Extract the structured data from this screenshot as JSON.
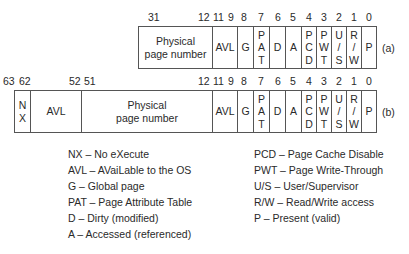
{
  "row_a": {
    "tag": "(a)",
    "bits": [
      {
        "label": "31",
        "x": 148
      },
      {
        "label": "12",
        "x": 198
      },
      {
        "label": "11",
        "x": 213
      },
      {
        "label": "9",
        "x": 228
      },
      {
        "label": "8",
        "x": 241
      },
      {
        "label": "7",
        "x": 258
      },
      {
        "label": "6",
        "x": 275
      },
      {
        "label": "5",
        "x": 290
      },
      {
        "label": "4",
        "x": 306
      },
      {
        "label": "3",
        "x": 321
      },
      {
        "label": "2",
        "x": 336
      },
      {
        "label": "1",
        "x": 351
      },
      {
        "label": "0",
        "x": 366
      }
    ],
    "fields": [
      {
        "name": "physical-page-number",
        "lines": [
          "Physical",
          "page number"
        ],
        "x": 138,
        "w": 74
      },
      {
        "name": "avl",
        "lines": [
          "AVL"
        ],
        "x": 212,
        "w": 25
      },
      {
        "name": "g",
        "lines": [
          "G"
        ],
        "x": 237,
        "w": 16
      },
      {
        "name": "pat",
        "lines": [
          "P",
          "A",
          "T"
        ],
        "x": 253,
        "w": 16
      },
      {
        "name": "d",
        "lines": [
          "D"
        ],
        "x": 269,
        "w": 16
      },
      {
        "name": "a",
        "lines": [
          "A"
        ],
        "x": 285,
        "w": 16
      },
      {
        "name": "pcd",
        "lines": [
          "P",
          "C",
          "D"
        ],
        "x": 301,
        "w": 15
      },
      {
        "name": "pwt",
        "lines": [
          "P",
          "W",
          "T"
        ],
        "x": 316,
        "w": 15
      },
      {
        "name": "us",
        "lines": [
          "U",
          "/",
          "S"
        ],
        "x": 331,
        "w": 15
      },
      {
        "name": "rw",
        "lines": [
          "R",
          "/",
          "W"
        ],
        "x": 346,
        "w": 15
      },
      {
        "name": "p",
        "lines": [
          "P"
        ],
        "x": 361,
        "w": 15
      }
    ]
  },
  "row_b": {
    "tag": "(b)",
    "bits": [
      {
        "label": "63",
        "x": 3
      },
      {
        "label": "62",
        "x": 19
      },
      {
        "label": "52",
        "x": 69
      },
      {
        "label": "51",
        "x": 84
      },
      {
        "label": "12",
        "x": 198
      },
      {
        "label": "11",
        "x": 213
      },
      {
        "label": "9",
        "x": 228
      },
      {
        "label": "8",
        "x": 241
      },
      {
        "label": "7",
        "x": 258
      },
      {
        "label": "6",
        "x": 275
      },
      {
        "label": "5",
        "x": 290
      },
      {
        "label": "4",
        "x": 306
      },
      {
        "label": "3",
        "x": 321
      },
      {
        "label": "2",
        "x": 336
      },
      {
        "label": "1",
        "x": 351
      },
      {
        "label": "0",
        "x": 366
      }
    ],
    "fields": [
      {
        "name": "nx",
        "lines": [
          "N",
          "X"
        ],
        "x": 14,
        "w": 16
      },
      {
        "name": "avl-high",
        "lines": [
          "AVL"
        ],
        "x": 30,
        "w": 51
      },
      {
        "name": "physical-page-number",
        "lines": [
          "Physical",
          "page number"
        ],
        "x": 81,
        "w": 131
      },
      {
        "name": "avl",
        "lines": [
          "AVL"
        ],
        "x": 212,
        "w": 25
      },
      {
        "name": "g",
        "lines": [
          "G"
        ],
        "x": 237,
        "w": 16
      },
      {
        "name": "pat",
        "lines": [
          "P",
          "A",
          "T"
        ],
        "x": 253,
        "w": 16
      },
      {
        "name": "d",
        "lines": [
          "D"
        ],
        "x": 269,
        "w": 16
      },
      {
        "name": "a",
        "lines": [
          "A"
        ],
        "x": 285,
        "w": 16
      },
      {
        "name": "pcd",
        "lines": [
          "P",
          "C",
          "D"
        ],
        "x": 301,
        "w": 15
      },
      {
        "name": "pwt",
        "lines": [
          "P",
          "W",
          "T"
        ],
        "x": 316,
        "w": 15
      },
      {
        "name": "us",
        "lines": [
          "U",
          "/",
          "S"
        ],
        "x": 331,
        "w": 15
      },
      {
        "name": "rw",
        "lines": [
          "R",
          "/",
          "W"
        ],
        "x": 346,
        "w": 15
      },
      {
        "name": "p",
        "lines": [
          "P"
        ],
        "x": 361,
        "w": 15
      }
    ]
  },
  "legend_left": [
    "NX – No eXecute",
    "AVL – AVaiLable to the OS",
    "G – Global page",
    "PAT – Page Attribute Table",
    "D – Dirty (modified)",
    "A – Accessed (referenced)"
  ],
  "legend_right": [
    "PCD – Page Cache Disable",
    "PWT – Page Write-Through",
    "U/S – User/Supervisor",
    "R/W – Read/Write access",
    "P – Present (valid)"
  ]
}
